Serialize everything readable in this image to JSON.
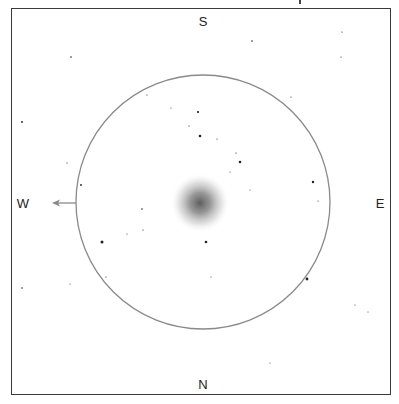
{
  "finder_chart": {
    "directions": {
      "top": "S",
      "bottom": "N",
      "left": "W",
      "right": "E"
    },
    "field_circle": {
      "cx": 203,
      "cy": 202,
      "r": 127,
      "color": "#8a8a8a"
    },
    "motion_arrow": {
      "direction": "W",
      "color": "#8a8a8a"
    },
    "object": {
      "type": "globular-cluster-glow",
      "cx": 200,
      "cy": 203,
      "r": 30
    },
    "stars": [
      {
        "x": 71,
        "y": 57,
        "r": 0.8
      },
      {
        "x": 22,
        "y": 122,
        "r": 0.9
      },
      {
        "x": 67,
        "y": 163,
        "r": 0.6
      },
      {
        "x": 147,
        "y": 95,
        "r": 0.6
      },
      {
        "x": 171,
        "y": 108,
        "r": 0.5
      },
      {
        "x": 198,
        "y": 112,
        "r": 1.1
      },
      {
        "x": 189,
        "y": 126,
        "r": 0.6
      },
      {
        "x": 200,
        "y": 136,
        "r": 1.3
      },
      {
        "x": 217,
        "y": 139,
        "r": 0.6
      },
      {
        "x": 236,
        "y": 153,
        "r": 0.6
      },
      {
        "x": 240,
        "y": 162,
        "r": 1.3
      },
      {
        "x": 230,
        "y": 172,
        "r": 0.5
      },
      {
        "x": 250,
        "y": 190,
        "r": 0.5
      },
      {
        "x": 81,
        "y": 185,
        "r": 0.9
      },
      {
        "x": 252,
        "y": 41,
        "r": 0.8
      },
      {
        "x": 342,
        "y": 32,
        "r": 0.6
      },
      {
        "x": 341,
        "y": 57,
        "r": 0.6
      },
      {
        "x": 291,
        "y": 97,
        "r": 0.6
      },
      {
        "x": 313,
        "y": 182,
        "r": 1.2
      },
      {
        "x": 318,
        "y": 201,
        "r": 0.5
      },
      {
        "x": 142,
        "y": 209,
        "r": 0.8
      },
      {
        "x": 127,
        "y": 234,
        "r": 0.5
      },
      {
        "x": 143,
        "y": 230,
        "r": 0.6
      },
      {
        "x": 102,
        "y": 242,
        "r": 1.5
      },
      {
        "x": 206,
        "y": 242,
        "r": 1.3
      },
      {
        "x": 106,
        "y": 277,
        "r": 0.6
      },
      {
        "x": 211,
        "y": 277,
        "r": 0.5
      },
      {
        "x": 307,
        "y": 279,
        "r": 1.4
      },
      {
        "x": 22,
        "y": 288,
        "r": 0.8
      },
      {
        "x": 70,
        "y": 284,
        "r": 0.5
      },
      {
        "x": 355,
        "y": 305,
        "r": 0.5
      },
      {
        "x": 368,
        "y": 312,
        "r": 0.5
      },
      {
        "x": 270,
        "y": 363,
        "r": 0.5
      }
    ]
  }
}
